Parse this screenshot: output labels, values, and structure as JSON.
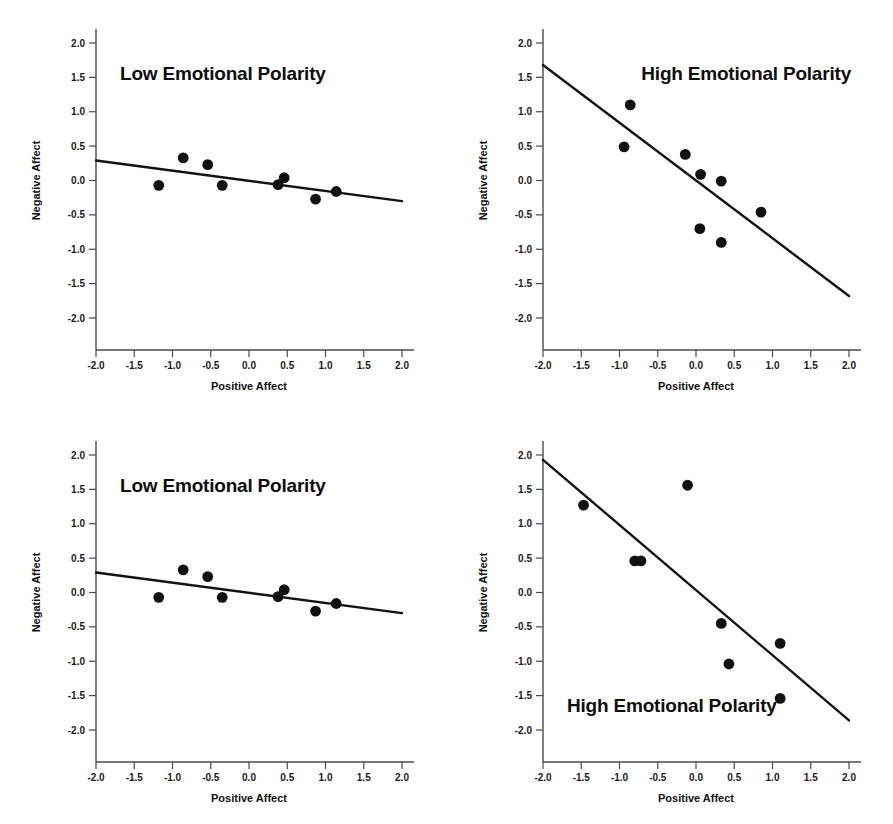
{
  "figure": {
    "background_color": "#ffffff",
    "ink_color": "#111111",
    "panel_count": 4
  },
  "chart_data": [
    {
      "id": "top-left",
      "type": "scatter",
      "title": "Low Emotional Polarity",
      "title_position": "top-left-inside",
      "xlabel": "Positive Affect",
      "ylabel": "Negative Affect",
      "xlim": [
        -2.0,
        2.0
      ],
      "ylim": [
        -2.0,
        2.0
      ],
      "xticks": [
        -2.0,
        -1.5,
        -1.0,
        -0.5,
        0.0,
        0.5,
        1.0,
        1.5,
        2.0
      ],
      "yticks": [
        2.0,
        1.5,
        1.0,
        0.5,
        0.0,
        -0.5,
        -1.0,
        -1.5,
        -2.0
      ],
      "xtick_labels": [
        "-2.0",
        "-1.5",
        "-1.0",
        "-0.5",
        "0.0",
        "0.5",
        "1.0",
        "1.5",
        "2.0"
      ],
      "ytick_labels": [
        "2.0",
        "1.5",
        "1.0",
        "0.5",
        "0.0",
        "-0.5",
        "-1.0",
        "-1.5",
        "-2.0"
      ],
      "grid": false,
      "legend": false,
      "points": [
        {
          "x": -1.18,
          "y": -0.07
        },
        {
          "x": -0.86,
          "y": 0.33
        },
        {
          "x": -0.54,
          "y": 0.23
        },
        {
          "x": -0.35,
          "y": -0.07
        },
        {
          "x": 0.38,
          "y": -0.06
        },
        {
          "x": 0.46,
          "y": 0.04
        },
        {
          "x": 0.87,
          "y": -0.27
        },
        {
          "x": 1.14,
          "y": -0.16
        }
      ],
      "fit_line": {
        "x0": -2.0,
        "y0": 0.29,
        "x1": 2.0,
        "y1": -0.3
      }
    },
    {
      "id": "top-right",
      "type": "scatter",
      "title": "High Emotional Polarity",
      "title_position": "top-right-inside",
      "xlabel": "Positive Affect",
      "ylabel": "Negative Affect",
      "xlim": [
        -2.0,
        2.0
      ],
      "ylim": [
        -2.0,
        2.0
      ],
      "xticks": [
        -2.0,
        -1.5,
        -1.0,
        -0.5,
        0.0,
        0.5,
        1.0,
        1.5,
        2.0
      ],
      "yticks": [
        2.0,
        1.5,
        1.0,
        0.5,
        0.0,
        -0.5,
        -1.0,
        -1.5,
        -2.0
      ],
      "xtick_labels": [
        "-2.0",
        "-1.5",
        "-1.0",
        "-0.5",
        "0.0",
        "0.5",
        "1.0",
        "1.5",
        "2.0"
      ],
      "ytick_labels": [
        "2.0",
        "1.5",
        "1.0",
        "0.5",
        "0.0",
        "-0.5",
        "-1.0",
        "-1.5",
        "-2.0"
      ],
      "grid": false,
      "legend": false,
      "points": [
        {
          "x": -0.86,
          "y": 1.1
        },
        {
          "x": -0.94,
          "y": 0.49
        },
        {
          "x": -0.14,
          "y": 0.38
        },
        {
          "x": 0.06,
          "y": 0.09
        },
        {
          "x": 0.33,
          "y": -0.01
        },
        {
          "x": 0.85,
          "y": -0.46
        },
        {
          "x": 0.05,
          "y": -0.7
        },
        {
          "x": 0.33,
          "y": -0.9
        }
      ],
      "fit_line": {
        "x0": -2.0,
        "y0": 1.68,
        "x1": 2.0,
        "y1": -1.68
      }
    },
    {
      "id": "bottom-left",
      "type": "scatter",
      "title": "Low Emotional Polarity",
      "title_position": "top-left-inside",
      "xlabel": "Positive Affect",
      "ylabel": "Negative Affect",
      "xlim": [
        -2.0,
        2.0
      ],
      "ylim": [
        -2.0,
        2.0
      ],
      "xticks": [
        -2.0,
        -1.5,
        -1.0,
        -0.5,
        0.0,
        0.5,
        1.0,
        1.5,
        2.0
      ],
      "yticks": [
        2.0,
        1.5,
        1.0,
        0.5,
        0.0,
        -0.5,
        -1.0,
        -1.5,
        -2.0
      ],
      "xtick_labels": [
        "-2.0",
        "-1.5",
        "-1.0",
        "-0.5",
        "0.0",
        "0.5",
        "1.0",
        "1.5",
        "2.0"
      ],
      "ytick_labels": [
        "2.0",
        "1.5",
        "1.0",
        "0.5",
        "0.0",
        "-0.5",
        "-1.0",
        "-1.5",
        "-2.0"
      ],
      "grid": false,
      "legend": false,
      "points": [
        {
          "x": -1.18,
          "y": -0.07
        },
        {
          "x": -0.86,
          "y": 0.33
        },
        {
          "x": -0.54,
          "y": 0.23
        },
        {
          "x": -0.35,
          "y": -0.07
        },
        {
          "x": 0.38,
          "y": -0.06
        },
        {
          "x": 0.46,
          "y": 0.04
        },
        {
          "x": 0.87,
          "y": -0.27
        },
        {
          "x": 1.14,
          "y": -0.16
        }
      ],
      "fit_line": {
        "x0": -2.0,
        "y0": 0.29,
        "x1": 2.0,
        "y1": -0.3
      }
    },
    {
      "id": "bottom-right",
      "type": "scatter",
      "title": "High Emotional Polarity",
      "title_position": "bottom-left-inside",
      "xlabel": "Positive Affect",
      "ylabel": "Negative Affect",
      "xlim": [
        -2.0,
        2.0
      ],
      "ylim": [
        -2.0,
        2.0
      ],
      "xticks": [
        -2.0,
        -1.5,
        -1.0,
        -0.5,
        0.0,
        0.5,
        1.0,
        1.5,
        2.0
      ],
      "yticks": [
        2.0,
        1.5,
        1.0,
        0.5,
        0.0,
        -0.5,
        -1.0,
        -1.5,
        -2.0
      ],
      "xtick_labels": [
        "-2.0",
        "-1.5",
        "-1.0",
        "-0.5",
        "0.0",
        "0.5",
        "1.0",
        "1.5",
        "2.0"
      ],
      "ytick_labels": [
        "2.0",
        "1.5",
        "1.0",
        "0.5",
        "0.0",
        "-0.5",
        "-1.0",
        "-1.5",
        "-2.0"
      ],
      "grid": false,
      "legend": false,
      "points": [
        {
          "x": -1.47,
          "y": 1.27
        },
        {
          "x": -0.11,
          "y": 1.56
        },
        {
          "x": -0.8,
          "y": 0.46
        },
        {
          "x": -0.72,
          "y": 0.46
        },
        {
          "x": 0.33,
          "y": -0.45
        },
        {
          "x": 1.1,
          "y": -0.74
        },
        {
          "x": 0.43,
          "y": -1.04
        },
        {
          "x": 1.1,
          "y": -1.54
        }
      ],
      "fit_line": {
        "x0": -2.0,
        "y0": 1.93,
        "x1": 2.0,
        "y1": -1.86
      }
    }
  ]
}
